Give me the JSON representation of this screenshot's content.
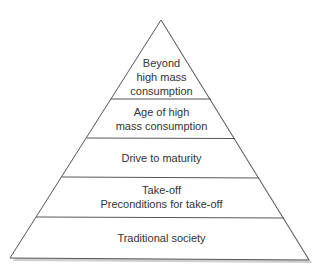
{
  "diagram": {
    "type": "pyramid",
    "levels_top_to_bottom": [
      {
        "lines": [
          "Beyond",
          "high mass",
          "consumption"
        ]
      },
      {
        "lines": [
          "Age of high",
          "mass consumption"
        ]
      },
      {
        "lines": [
          "Drive to maturity"
        ]
      },
      {
        "lines": [
          "Take-off",
          "Preconditions for take-off"
        ]
      },
      {
        "lines": [
          "Traditional society"
        ]
      }
    ],
    "colors": {
      "outline": "#555555",
      "shadow": "#bbbbbb",
      "text": "#333333",
      "fill": "#ffffff"
    }
  }
}
